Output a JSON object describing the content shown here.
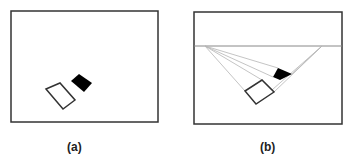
{
  "figure": {
    "panels": [
      {
        "id": "a",
        "caption": "(a)",
        "description": "Two quadrilaterals (one outlined white, one filled black) inside a frame"
      },
      {
        "id": "b",
        "caption": "(b)",
        "description": "Same quadrilaterals with horizon line and perspective lines to two vanishing points"
      }
    ],
    "colors": {
      "frame": "#333333",
      "horizon": "#888888",
      "perspective_lines": "#b0b0b0",
      "filled_shape": "#000000",
      "outline_shape": "#333333"
    }
  }
}
